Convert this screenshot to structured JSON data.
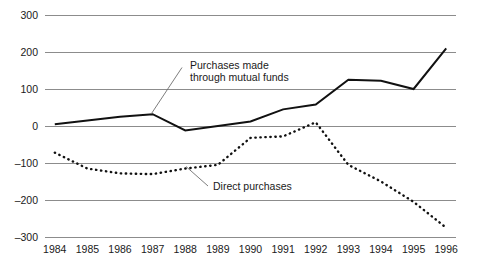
{
  "chart_data": {
    "type": "line",
    "title": "",
    "subtitle": "",
    "xlabel": "",
    "ylabel": "",
    "categories": [
      "1984",
      "1985",
      "1986",
      "1987",
      "1988",
      "1989",
      "1990",
      "1991",
      "1992",
      "1993",
      "1994",
      "1995",
      "1996"
    ],
    "x": [
      1984,
      1985,
      1986,
      1987,
      1988,
      1989,
      1990,
      1991,
      1992,
      1993,
      1994,
      1995,
      1996
    ],
    "xlim": [
      1983.7,
      1996.3
    ],
    "ylim": [
      -300,
      300
    ],
    "yticks": [
      300,
      200,
      100,
      0,
      -100,
      -200,
      -300
    ],
    "ytick_labels": [
      "300",
      "200",
      "100",
      "0",
      "–100",
      "–200",
      "–300"
    ],
    "grid": "horizontal",
    "legend": "annotations",
    "series": [
      {
        "name": "Purchases made through mutual funds",
        "style": "solid",
        "values": [
          5,
          15,
          25,
          32,
          -12,
          0,
          12,
          45,
          58,
          125,
          122,
          100,
          210
        ]
      },
      {
        "name": "Direct purchases",
        "style": "dotted",
        "values": [
          -72,
          -115,
          -128,
          -130,
          -115,
          -105,
          -32,
          -28,
          10,
          -105,
          -150,
          -205,
          -275
        ]
      }
    ],
    "annotations": [
      {
        "id": "mutual-funds-annotation",
        "line1": "Purchases made",
        "line2": "through mutual funds"
      },
      {
        "id": "direct-purchases-annotation",
        "line1": "Direct purchases",
        "line2": ""
      }
    ],
    "colors": {
      "series_line": "#111111",
      "grid": "#8c8c8c",
      "text": "#1a1a1a",
      "background": "#ffffff",
      "leader": "#6e6e6e"
    }
  }
}
